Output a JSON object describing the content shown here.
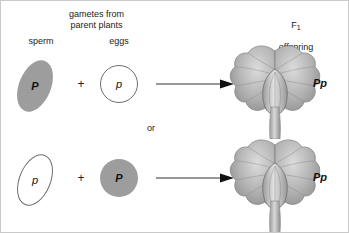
{
  "diagram": {
    "title_gametes": "gametes from\nparent plants",
    "label_sperm": "sperm",
    "label_eggs": "eggs",
    "label_f1_generation": "F",
    "label_f1_subscript": "1",
    "label_offspring": "offspring",
    "label_or": "or",
    "plus_symbol": "+"
  },
  "crosses": [
    {
      "sperm_allele": "P",
      "sperm_shape": "filled-ellipse",
      "egg_allele": "p",
      "egg_shape": "open-circle",
      "offspring_genotype": "Pp"
    },
    {
      "sperm_allele": "p",
      "sperm_shape": "open-ellipse",
      "egg_allele": "P",
      "egg_shape": "filled-circle",
      "offspring_genotype": "Pp"
    }
  ],
  "colors": {
    "gamete_fill": "#9d9d9d",
    "gamete_stroke": "#6d6d6d",
    "text": "#1b1b1b",
    "arrow": "#333333",
    "flower_light": "#d6d6d6",
    "flower_mid": "#a8a8a8",
    "flower_dark": "#7e7e7e",
    "background": "#ffffff"
  }
}
